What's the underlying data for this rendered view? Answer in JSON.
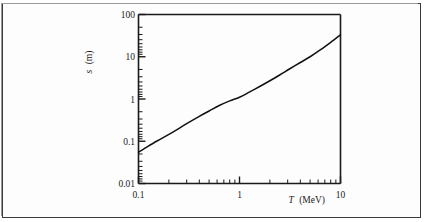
{
  "chart_data": {
    "type": "line",
    "title": "",
    "subtitle": "",
    "xlabel_symbol": "T",
    "xlabel_unit": "(MeV)",
    "xlabel": "T (MeV)",
    "ylabel_symbol": "s",
    "ylabel_unit": "(m)",
    "ylabel": "s (m)",
    "xscale": "log",
    "yscale": "log",
    "xlim": [
      0.1,
      10
    ],
    "ylim": [
      0.01,
      100
    ],
    "grid": false,
    "legend": null,
    "legend_position": "none",
    "xticklabels": [
      "0.1",
      "1",
      "10"
    ],
    "xtickvalues": [
      0.1,
      1,
      10
    ],
    "yticklabels": [
      "0.01",
      "0.1",
      "1",
      "10",
      "100"
    ],
    "ytickvalues": [
      0.01,
      0.1,
      1,
      10,
      100
    ],
    "minor_ticks": true,
    "series": [
      {
        "name": "s",
        "x": [
          0.1,
          0.125,
          0.16,
          0.2,
          0.25,
          0.315,
          0.4,
          0.5,
          0.63,
          0.8,
          1.0,
          1.25,
          1.6,
          2.0,
          2.5,
          3.15,
          4.0,
          5.0,
          6.3,
          8.0,
          10.0
        ],
        "y": [
          0.055,
          0.077,
          0.108,
          0.145,
          0.2,
          0.28,
          0.39,
          0.52,
          0.7,
          0.9,
          1.1,
          1.45,
          2.0,
          2.7,
          3.7,
          5.2,
          7.3,
          10.0,
          14.5,
          22.0,
          33.0
        ]
      }
    ]
  },
  "figure": {
    "caption": ""
  }
}
